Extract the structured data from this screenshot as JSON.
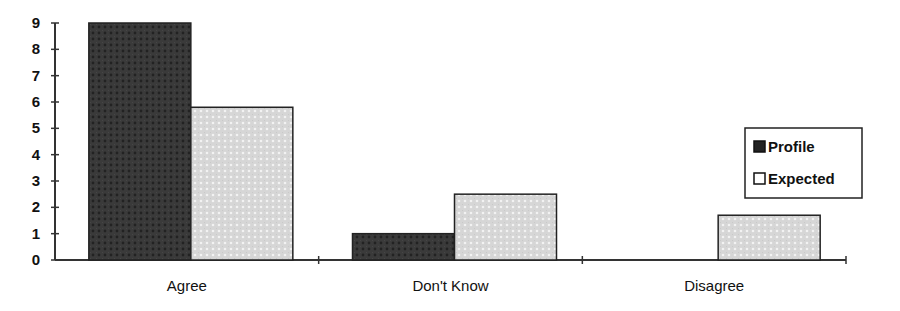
{
  "chart_data": {
    "type": "bar",
    "title": "",
    "xlabel": "",
    "ylabel": "",
    "categories": [
      "Agree",
      "Don't Know",
      "Disagree"
    ],
    "series": [
      {
        "name": "Profile",
        "values": [
          9,
          1,
          0
        ],
        "color": "#3a3a3a"
      },
      {
        "name": "Expected",
        "values": [
          5.8,
          2.5,
          1.7
        ],
        "color": "#d4d4d4"
      }
    ],
    "ylim": [
      0,
      9
    ],
    "yticks": [
      0,
      1,
      2,
      3,
      4,
      5,
      6,
      7,
      8,
      9
    ],
    "grid": false,
    "legend_position": "right"
  },
  "legend": {
    "items": [
      {
        "label": "Profile"
      },
      {
        "label": "Expected"
      }
    ]
  }
}
